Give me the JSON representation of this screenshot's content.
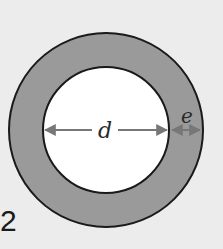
{
  "figure": {
    "number": "2",
    "labels": {
      "inner_diameter": "d",
      "thickness": "e"
    },
    "colors": {
      "background": "#ececec",
      "ring_fill": "#9a9a9a",
      "inner_fill": "#ffffff",
      "outline": "#1a1a1a",
      "arrow": "#777777"
    }
  }
}
